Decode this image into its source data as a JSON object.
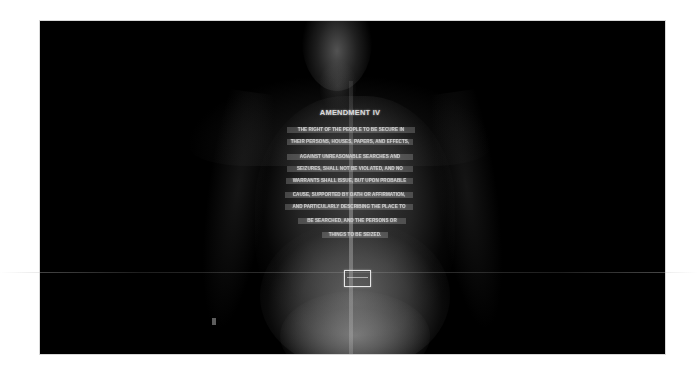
{
  "image": {
    "description": "Full-body X-ray (chest to pelvis) with text of the Fourth Amendment rendered across the ribcage",
    "background_color": "#000000",
    "page_color": "#ffffff"
  },
  "amendment": {
    "title": "AMENDMENT IV",
    "lines": [
      "The right of the people to be secure in",
      "their persons, houses, papers, and effects,",
      "against unreasonable searches and",
      "seizures, shall not be violated, and no",
      "Warrants shall issue, but upon probable",
      "cause, supported by Oath or affirmation,",
      "and particularly describing the place to",
      "be searched, and the persons or",
      "things to be seized."
    ]
  },
  "objects": {
    "device_box": "rectangular-implant",
    "scan_line": "horizontal-scan-artifact"
  }
}
